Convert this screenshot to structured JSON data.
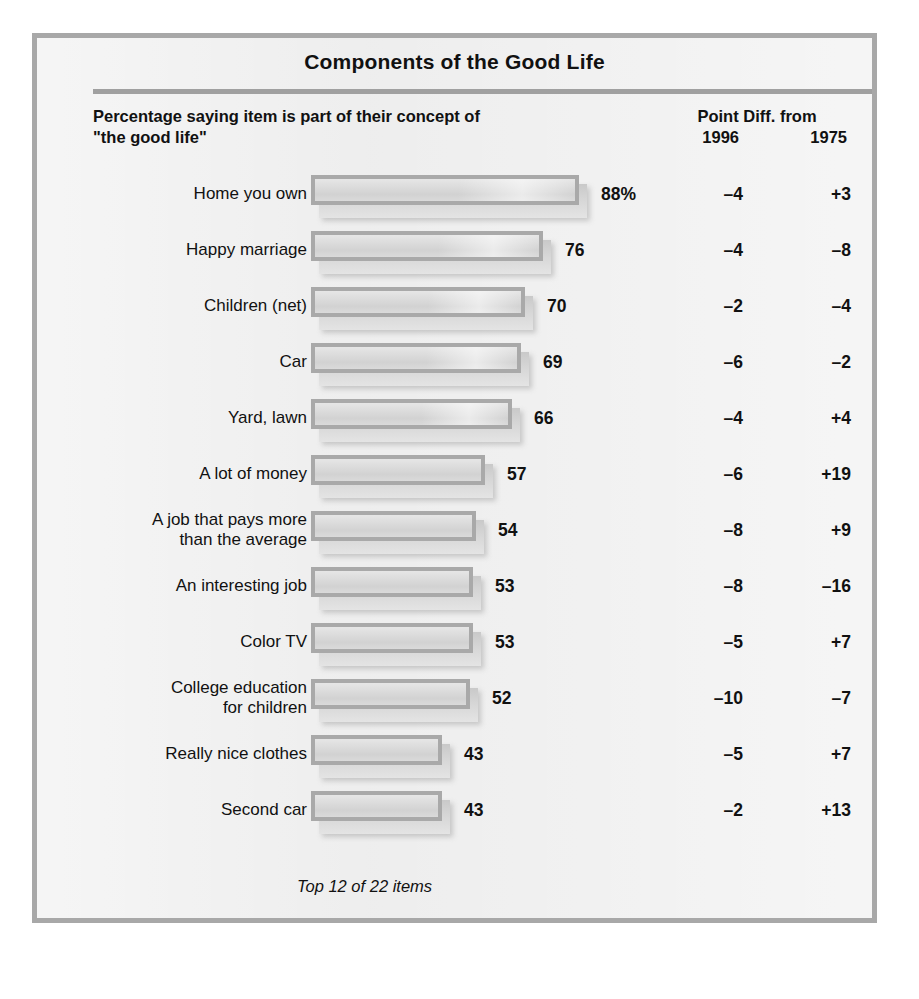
{
  "title": "Components of the Good Life",
  "subheader": "Percentage saying item is part of\ntheir concept of \"the good life\"",
  "column_header": {
    "top": "Point Diff. from",
    "year_1996": "1996",
    "year_1975": "1975"
  },
  "footnote": "Top 12 of 22 items",
  "colors": {
    "frame_border": "#a8a8a8",
    "panel_background": "#eaeaea",
    "bar_fill": "#d8d8d8",
    "bar_border": "#a9a9a9",
    "rule": "#a0a0a0",
    "text": "#111111"
  },
  "chart_data": {
    "type": "bar",
    "title": "Components of the Good Life",
    "subtitle": "Percentage saying item is part of their concept of \"the good life\"",
    "xlabel": "",
    "ylabel": "",
    "orientation": "horizontal",
    "xlim": [
      0,
      100
    ],
    "grid": false,
    "legend": "none",
    "note": "Top 12 of 22 items",
    "categories": [
      "Home you own",
      "Happy marriage",
      "Children (net)",
      "Car",
      "Yard, lawn",
      "A lot of money",
      "A job that pays more than the average",
      "An interesting job",
      "Color TV",
      "College education for children",
      "Really nice clothes",
      "Second car"
    ],
    "values": [
      88,
      76,
      70,
      69,
      66,
      57,
      54,
      53,
      53,
      52,
      43,
      43
    ],
    "value_labels": [
      "88%",
      "76",
      "70",
      "69",
      "66",
      "57",
      "54",
      "53",
      "53",
      "52",
      "43",
      "43"
    ],
    "series": [
      {
        "name": "Percentage 1996",
        "values": [
          88,
          76,
          70,
          69,
          66,
          57,
          54,
          53,
          53,
          52,
          43,
          43
        ]
      },
      {
        "name": "Point Diff. from 1996",
        "values": [
          -4,
          -4,
          -2,
          -6,
          -4,
          -6,
          -8,
          -8,
          -5,
          -10,
          -5,
          -2
        ]
      },
      {
        "name": "Point Diff. from 1975",
        "values": [
          3,
          -8,
          -4,
          -2,
          4,
          19,
          9,
          -16,
          7,
          -7,
          7,
          13
        ]
      }
    ]
  },
  "rows": [
    {
      "label": "Home you own",
      "value": 88,
      "value_label": "88%",
      "diff_1996": "–4",
      "diff_1975": "+3"
    },
    {
      "label": "Happy marriage",
      "value": 76,
      "value_label": "76",
      "diff_1996": "–4",
      "diff_1975": "–8"
    },
    {
      "label": "Children (net)",
      "value": 70,
      "value_label": "70",
      "diff_1996": "–2",
      "diff_1975": "–4"
    },
    {
      "label": "Car",
      "value": 69,
      "value_label": "69",
      "diff_1996": "–6",
      "diff_1975": "–2"
    },
    {
      "label": "Yard, lawn",
      "value": 66,
      "value_label": "66",
      "diff_1996": "–4",
      "diff_1975": "+4"
    },
    {
      "label": "A lot of money",
      "value": 57,
      "value_label": "57",
      "diff_1996": "–6",
      "diff_1975": "+19"
    },
    {
      "label": "A job that pays more\nthan the average",
      "value": 54,
      "value_label": "54",
      "diff_1996": "–8",
      "diff_1975": "+9"
    },
    {
      "label": "An interesting job",
      "value": 53,
      "value_label": "53",
      "diff_1996": "–8",
      "diff_1975": "–16"
    },
    {
      "label": "Color TV",
      "value": 53,
      "value_label": "53",
      "diff_1996": "–5",
      "diff_1975": "+7"
    },
    {
      "label": "College education\nfor children",
      "value": 52,
      "value_label": "52",
      "diff_1996": "–10",
      "diff_1975": "–7"
    },
    {
      "label": "Really nice clothes",
      "value": 43,
      "value_label": "43",
      "diff_1996": "–5",
      "diff_1975": "+7"
    },
    {
      "label": "Second car",
      "value": 43,
      "value_label": "43",
      "diff_1996": "–2",
      "diff_1975": "+13"
    }
  ]
}
